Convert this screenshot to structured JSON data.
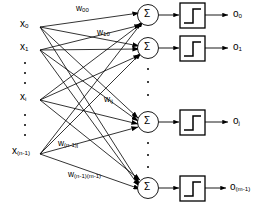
{
  "diagram": {
    "type": "neural-network-diagram",
    "colors": {
      "stroke": "#000000",
      "background": "#ffffff"
    },
    "node_glyph": "Σ",
    "activation": "step-function",
    "inputs": [
      {
        "id": "x0",
        "base": "x",
        "sub": "0",
        "x": 22,
        "y": 25
      },
      {
        "id": "x1",
        "base": "x",
        "sub": "1",
        "x": 22,
        "y": 48
      },
      {
        "id": "xi",
        "base": "x",
        "sub": "i",
        "x": 22,
        "y": 98
      },
      {
        "id": "xn1",
        "base": "x",
        "sub": "(n-1)",
        "x": 14,
        "y": 152
      }
    ],
    "input_ellipses": [
      {
        "x": 26,
        "y": 62,
        "h": 22
      },
      {
        "x": 26,
        "y": 114,
        "h": 22
      }
    ],
    "weights": [
      {
        "id": "w00",
        "base": "w",
        "sub": "00",
        "x": 76,
        "y": 8
      },
      {
        "id": "w10",
        "base": "w",
        "sub": "10",
        "x": 97,
        "y": 33
      },
      {
        "id": "wij",
        "base": "w",
        "sub": "ij",
        "x": 104,
        "y": 100
      },
      {
        "id": "wn1j",
        "base": "w",
        "sub": "(n-1)j",
        "x": 58,
        "y": 143
      },
      {
        "id": "wn1m1",
        "base": "w",
        "sub": "(n-1)(m-1)",
        "x": 68,
        "y": 175
      }
    ],
    "sum_nodes": [
      {
        "id": "sum0",
        "label": "Σ",
        "cx": 148,
        "cy": 15
      },
      {
        "id": "sum1",
        "label": "Σ",
        "cx": 148,
        "cy": 48
      },
      {
        "id": "sumj",
        "label": "Σ",
        "cx": 148,
        "cy": 122
      },
      {
        "id": "summ1",
        "label": "Σ",
        "cx": 148,
        "cy": 188
      }
    ],
    "activation_boxes": [
      {
        "id": "act0",
        "cx": 193,
        "cy": 15
      },
      {
        "id": "act1",
        "cx": 193,
        "cy": 48
      },
      {
        "id": "actj",
        "cx": 193,
        "cy": 122
      },
      {
        "id": "actm1",
        "cx": 193,
        "cy": 188
      }
    ],
    "outputs": [
      {
        "id": "o0",
        "base": "o",
        "sub": "0",
        "x": 235,
        "y": 15
      },
      {
        "id": "o1",
        "base": "o",
        "sub": "1",
        "x": 235,
        "y": 48
      },
      {
        "id": "oj",
        "base": "o",
        "sub": "j",
        "x": 235,
        "y": 122
      },
      {
        "id": "om1",
        "base": "o",
        "sub": "(m-1)",
        "x": 231,
        "y": 188
      }
    ],
    "node_ellipses": [
      {
        "x": 148,
        "y": 82,
        "h": 28
      },
      {
        "x": 148,
        "y": 155,
        "h": 26
      }
    ]
  }
}
